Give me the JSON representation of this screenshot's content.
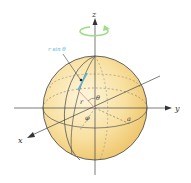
{
  "diagram": {
    "type": "spherical-coordinates",
    "axes": {
      "x": "x",
      "y": "y",
      "z": "z"
    },
    "labels": {
      "r_sin_theta": "r sin θ",
      "r": "r",
      "theta": "θ",
      "phi": "φ",
      "radius": "a"
    },
    "colors": {
      "sphere_fill": "#f7dc8e",
      "sphere_highlight": "#fdf3d2",
      "outline": "#3a3a3a",
      "rotation_arrow": "#9ddc8a",
      "r_sin_theta": "#4fb3e0",
      "r_segment": "#e79a9a",
      "axis": "#444444"
    }
  }
}
